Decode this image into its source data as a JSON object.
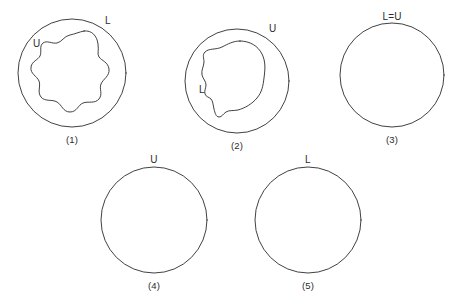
{
  "figure": {
    "title": "",
    "background_color": "#ffffff",
    "stroke_color": "#2b2b2b",
    "panels": [
      {
        "id": "panel-1",
        "caption": "(1)",
        "caption_x": 72,
        "caption_y": 136,
        "outer_circle": {
          "cx": 72,
          "cy": 73,
          "r": 54
        },
        "inner_shape": "irregular-star-blob",
        "labels": [
          {
            "text": "L",
            "x": 105,
            "y": 21,
            "name": "label-L"
          },
          {
            "text": "U",
            "x": 36,
            "y": 43,
            "name": "label-U"
          }
        ]
      },
      {
        "id": "panel-2",
        "caption": "(2)",
        "caption_x": 237,
        "caption_y": 142,
        "outer_circle": {
          "cx": 237,
          "cy": 81,
          "r": 52
        },
        "inner_shape": "irregular-rounded-blob",
        "labels": [
          {
            "text": "U",
            "x": 272,
            "y": 29,
            "name": "label-U"
          },
          {
            "text": "L",
            "x": 203,
            "y": 89,
            "name": "label-L"
          }
        ]
      },
      {
        "id": "panel-3",
        "caption": "(3)",
        "caption_x": 392,
        "caption_y": 136,
        "outer_circle": {
          "cx": 392,
          "cy": 75,
          "r": 52
        },
        "inner_shape": "none",
        "labels": [
          {
            "text": "L=U",
            "x": 377,
            "y": 12,
            "name": "label-L-equals-U"
          }
        ]
      },
      {
        "id": "panel-4",
        "caption": "(4)",
        "caption_x": 154,
        "caption_y": 282,
        "outer_circle": {
          "cx": 154,
          "cy": 220,
          "r": 53
        },
        "inner_shape": "none",
        "labels": [
          {
            "text": "U",
            "x": 150,
            "y": 155,
            "name": "label-U"
          }
        ]
      },
      {
        "id": "panel-5",
        "caption": "(5)",
        "caption_x": 308,
        "caption_y": 282,
        "outer_circle": {
          "cx": 308,
          "cy": 220,
          "r": 53
        },
        "inner_shape": "none",
        "labels": [
          {
            "text": "L",
            "x": 305,
            "y": 155,
            "name": "label-L"
          }
        ]
      }
    ]
  }
}
